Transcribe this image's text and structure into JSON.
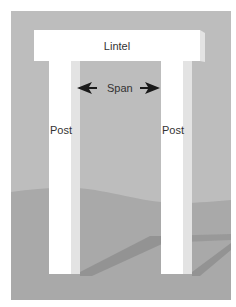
{
  "diagram": {
    "title_hidden": "",
    "labels": {
      "lintel": "Lintel",
      "span": "Span",
      "post_left": "Post",
      "post_right": "Post"
    },
    "arrows": {
      "left": "left-arrow",
      "right": "right-arrow"
    },
    "colors": {
      "background": "#ffffff",
      "sky": "#bdbdbd",
      "ground": "#a9a9a9",
      "shadow": "#8f8f8f",
      "stone_face": "#ffffff",
      "stone_side": "#e3e3e3",
      "text": "#333333",
      "arrow": "#1a1a1a"
    }
  }
}
